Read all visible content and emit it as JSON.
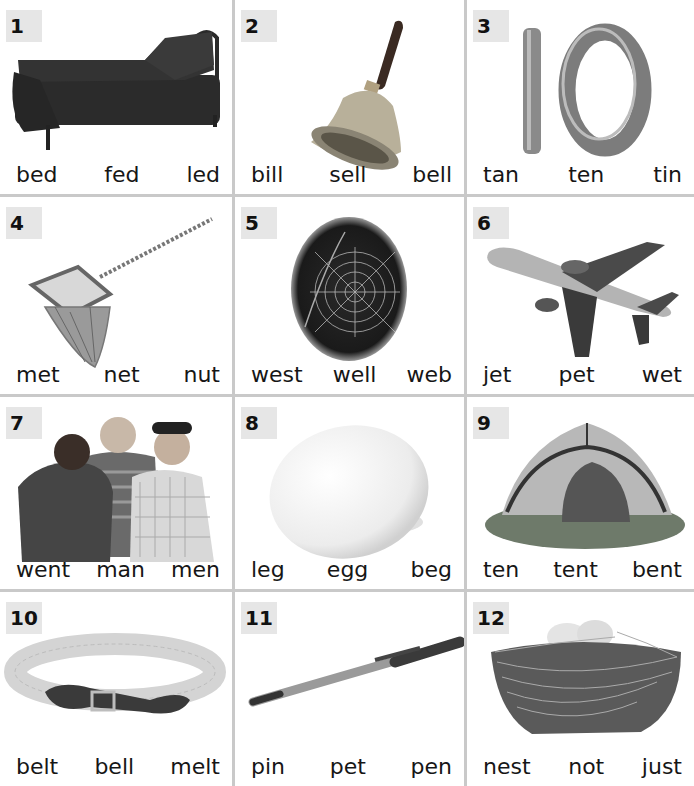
{
  "cells": [
    {
      "number": "1",
      "picture": "bed",
      "words": [
        "bed",
        "fed",
        "led"
      ]
    },
    {
      "number": "2",
      "picture": "bell",
      "words": [
        "bill",
        "sell",
        "bell"
      ]
    },
    {
      "number": "3",
      "picture": "ten",
      "words": [
        "tan",
        "ten",
        "tin"
      ]
    },
    {
      "number": "4",
      "picture": "net",
      "words": [
        "met",
        "net",
        "nut"
      ]
    },
    {
      "number": "5",
      "picture": "web",
      "words": [
        "west",
        "well",
        "web"
      ]
    },
    {
      "number": "6",
      "picture": "jet",
      "words": [
        "jet",
        "pet",
        "wet"
      ]
    },
    {
      "number": "7",
      "picture": "men",
      "words": [
        "went",
        "man",
        "men"
      ]
    },
    {
      "number": "8",
      "picture": "egg",
      "words": [
        "leg",
        "egg",
        "beg"
      ]
    },
    {
      "number": "9",
      "picture": "tent",
      "words": [
        "ten",
        "tent",
        "bent"
      ]
    },
    {
      "number": "10",
      "picture": "belt",
      "words": [
        "belt",
        "bell",
        "melt"
      ]
    },
    {
      "number": "11",
      "picture": "pen",
      "words": [
        "pin",
        "pet",
        "pen"
      ]
    },
    {
      "number": "12",
      "picture": "nest",
      "words": [
        "nest",
        "not",
        "just"
      ]
    }
  ],
  "colors": {
    "grid_line": "#c9c9c9",
    "badge_bg": "#e6e6e6",
    "text": "#161616"
  }
}
